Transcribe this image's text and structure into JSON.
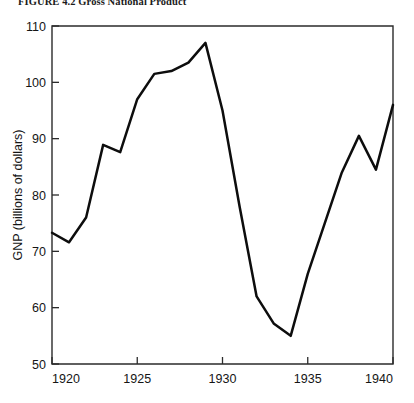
{
  "figure": {
    "title": "FIGURE 4.2  Gross National Product"
  },
  "chart_data": {
    "type": "line",
    "title": "FIGURE 4.2  Gross National Product",
    "xlabel": "",
    "ylabel": "GNP (billions of dollars)",
    "xlim": [
      1920,
      1940
    ],
    "ylim": [
      50,
      110
    ],
    "xticks": [
      1920,
      1925,
      1930,
      1935,
      1940
    ],
    "xtick_labels": [
      "1920",
      "1925",
      "1930",
      "1935",
      "1940"
    ],
    "yticks": [
      50,
      60,
      70,
      80,
      90,
      100,
      110
    ],
    "ytick_labels": [
      "50",
      "60",
      "70",
      "80",
      "90",
      "100",
      "110"
    ],
    "grid": false,
    "legend": null,
    "series": [
      {
        "name": "GNP",
        "x": [
          1920,
          1921,
          1922,
          1923,
          1924,
          1925,
          1926,
          1927,
          1928,
          1929,
          1930,
          1931,
          1932,
          1933,
          1934,
          1935,
          1936,
          1937,
          1938,
          1939,
          1940
        ],
        "values": [
          73.3,
          71.6,
          76.0,
          88.9,
          87.6,
          97.0,
          101.5,
          102.0,
          103.5,
          107.0,
          95.0,
          78.0,
          62.0,
          57.2,
          55.0,
          66.0,
          75.0,
          84.0,
          90.5,
          84.5,
          96.0
        ]
      }
    ]
  }
}
